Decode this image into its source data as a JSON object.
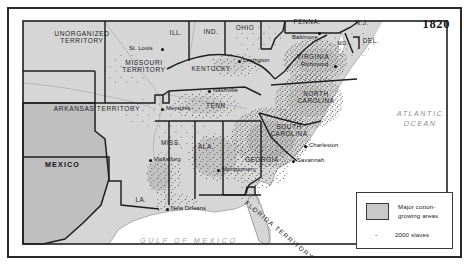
{
  "figure": {
    "date_label": "1820",
    "title_semantic": "Major cotton-growing areas and slave distribution, 1820"
  },
  "legend": {
    "swatch_label": "Major cotton-\ngrowing areas",
    "swatch_color": "#c9c9c9",
    "dot_label": "2000 slaves",
    "dot_glyph": "·"
  },
  "water": {
    "atlantic": "ATLANTIC\nOCEAN",
    "gulf": "GULF OF MEXICO",
    "color": "#9a9a9a"
  },
  "countries": [
    {
      "name": "MEXICO",
      "x": 36,
      "y": 155
    }
  ],
  "territories": [
    {
      "name": "UNORGANIZED\nTERRITORY",
      "x": 25,
      "y": 26
    },
    {
      "name": "MISSOURI\nTERRITORY",
      "x": 108,
      "y": 55
    },
    {
      "name": "ARKANSAS TERRITORY",
      "x": 41,
      "y": 100
    },
    {
      "name": "FLORIDA TERRITORY",
      "x": 240,
      "y": 190
    }
  ],
  "states": [
    {
      "name": "ILL.",
      "x": 164,
      "y": 23
    },
    {
      "name": "IND.",
      "x": 199,
      "y": 22
    },
    {
      "name": "OHIO",
      "x": 233,
      "y": 18
    },
    {
      "name": "PENNA.",
      "x": 291,
      "y": 11
    },
    {
      "name": "N.J.",
      "x": 352,
      "y": 13
    },
    {
      "name": "DEL.",
      "x": 359,
      "y": 30
    },
    {
      "name": "MD.",
      "x": 331,
      "y": 33
    },
    {
      "name": "VIRGINIA",
      "x": 295,
      "y": 47
    },
    {
      "name": "KENTUCKY",
      "x": 192,
      "y": 58
    },
    {
      "name": "TENN.",
      "x": 205,
      "y": 96
    },
    {
      "name": "NORTH\nCAROLINA",
      "x": 303,
      "y": 87
    },
    {
      "name": "SOUTH\nCAROLINA",
      "x": 279,
      "y": 120
    },
    {
      "name": "GEORGIA",
      "x": 251,
      "y": 150
    },
    {
      "name": "ALA.",
      "x": 196,
      "y": 137
    },
    {
      "name": "MISS.",
      "x": 160,
      "y": 133
    },
    {
      "name": "LA.",
      "x": 130,
      "y": 190
    }
  ],
  "cities": [
    {
      "name": "St. Louis",
      "x": 126,
      "y": 41,
      "dot_x": 156,
      "dot_y": 40
    },
    {
      "name": "Lexington",
      "x": 239,
      "y": 52,
      "dot_x": 234,
      "dot_y": 53
    },
    {
      "name": "Baltimore",
      "x": 313,
      "y": 27,
      "dot_x": 340,
      "dot_y": 24
    },
    {
      "name": "Richmond",
      "x": 300,
      "y": 57,
      "dot_x": 333,
      "dot_y": 58
    },
    {
      "name": "Nashville",
      "x": 208,
      "y": 85,
      "dot_x": 204,
      "dot_y": 86
    },
    {
      "name": "Memphis",
      "x": 161,
      "y": 102,
      "dot_x": 157,
      "dot_y": 103
    },
    {
      "name": "Vicksburg",
      "x": 148,
      "y": 152,
      "dot_x": 144,
      "dot_y": 153
    },
    {
      "name": "Montgomery",
      "x": 217,
      "y": 161,
      "dot_x": 213,
      "dot_y": 162
    },
    {
      "name": "Charleston",
      "x": 305,
      "y": 141,
      "dot_x": 300,
      "dot_y": 141
    },
    {
      "name": "Savannah",
      "x": 292,
      "y": 155,
      "dot_x": 288,
      "dot_y": 155
    },
    {
      "name": "New Orleans",
      "x": 166,
      "y": 202,
      "dot_x": 162,
      "dot_y": 202
    }
  ]
}
